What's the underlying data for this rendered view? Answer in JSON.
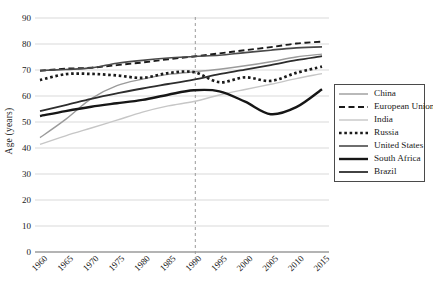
{
  "chart_data": {
    "type": "line",
    "title": "",
    "xlabel": "",
    "ylabel": "Age (years)",
    "ylim": [
      0,
      90
    ],
    "ytick_step": 10,
    "grid": "horizontal-light",
    "legend_position": "right-box",
    "x": [
      1960,
      1965,
      1970,
      1975,
      1980,
      1985,
      1990,
      1995,
      2000,
      2005,
      2010,
      2015
    ],
    "xticks": [
      1960,
      1965,
      1970,
      1975,
      1980,
      1985,
      1990,
      1995,
      2000,
      2005,
      2010,
      2015
    ],
    "reference_line": {
      "year": 1990,
      "orientation": "vertical",
      "style": "dashed",
      "color": "#9a9a9a"
    },
    "series": [
      {
        "name": "China",
        "color": "#9b9b9b",
        "style": "solid",
        "width": 1.4,
        "values": [
          44.0,
          51.0,
          59.0,
          64.0,
          66.5,
          68.3,
          69.3,
          70.3,
          71.6,
          73.2,
          75.0,
          76.1
        ]
      },
      {
        "name": "European Union",
        "color": "#1a1a1a",
        "style": "dashed",
        "width": 1.9,
        "values": [
          69.7,
          70.5,
          70.9,
          71.9,
          72.9,
          74.1,
          75.2,
          76.4,
          77.6,
          78.8,
          80.2,
          80.9
        ]
      },
      {
        "name": "India",
        "color": "#c6c6c6",
        "style": "solid",
        "width": 1.4,
        "values": [
          41.4,
          44.7,
          47.7,
          50.7,
          53.8,
          56.2,
          57.9,
          60.4,
          62.5,
          64.5,
          66.7,
          68.6
        ]
      },
      {
        "name": "Russia",
        "color": "#1a1a1a",
        "style": "dotted",
        "width": 2.7,
        "values": [
          66.1,
          68.4,
          68.5,
          67.9,
          67.0,
          68.8,
          69.2,
          65.3,
          67.2,
          65.8,
          68.9,
          71.3
        ]
      },
      {
        "name": "United States",
        "color": "#4a4a4a",
        "style": "solid",
        "width": 1.6,
        "values": [
          69.8,
          70.2,
          70.8,
          72.6,
          73.7,
          74.6,
          75.2,
          75.7,
          76.7,
          77.6,
          78.5,
          78.9
        ]
      },
      {
        "name": "South Africa",
        "color": "#161616",
        "style": "solid",
        "width": 2.4,
        "values": [
          52.3,
          54.2,
          55.9,
          57.2,
          58.5,
          60.5,
          62.2,
          61.8,
          57.8,
          53.0,
          55.7,
          62.6
        ]
      },
      {
        "name": "Brazil",
        "color": "#2d2d2d",
        "style": "solid",
        "width": 1.8,
        "values": [
          54.2,
          56.5,
          58.9,
          61.0,
          62.9,
          64.6,
          66.3,
          68.4,
          70.1,
          71.9,
          73.8,
          75.3
        ]
      }
    ]
  }
}
